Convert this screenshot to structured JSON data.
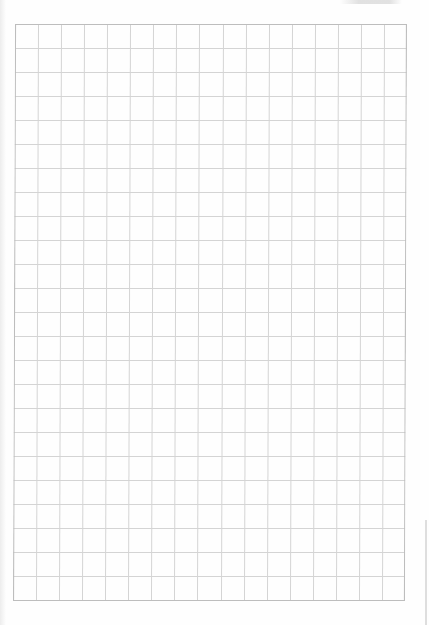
{
  "document": {
    "type": "graph-paper",
    "grid": {
      "columns": 17,
      "rows": 24,
      "line_color": "#d4d4d4",
      "border_color": "#bdbdbd",
      "paper_color": "#fefefe"
    }
  }
}
